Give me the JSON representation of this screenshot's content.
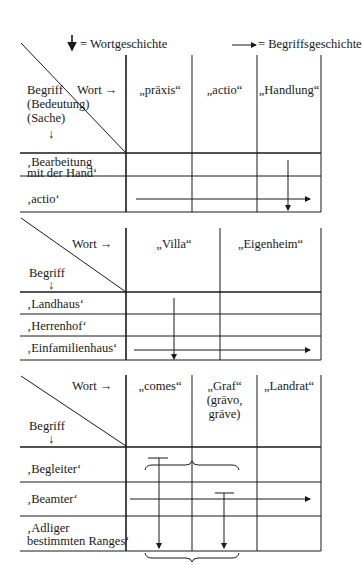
{
  "legend": {
    "word_history_symbol": "↓",
    "word_history_label": "= Wortgeschichte",
    "concept_history_symbol": "⟶",
    "concept_history_label": "= Begriffsgeschichte"
  },
  "table1": {
    "corner_word": "Wort →",
    "corner_concept_lines": [
      "Begriff",
      "(Bedeutung)",
      "(Sache)",
      "↓"
    ],
    "columns": [
      "„präxis“",
      "„actio“",
      "„Handlung“"
    ],
    "rows": [
      [
        "‚Bearbeitung",
        "mit der Hand‘"
      ],
      [
        "‚actio‘"
      ]
    ]
  },
  "table2": {
    "corner_word": "Wort →",
    "corner_concept_lines": [
      "Begriff",
      "↓"
    ],
    "columns": [
      "„Villa“",
      "„Eigenheim“"
    ],
    "rows": [
      [
        "‚Landhaus‘"
      ],
      [
        "‚Herrenhof‘"
      ],
      [
        "‚Einfamilienhaus‘"
      ]
    ]
  },
  "table3": {
    "corner_word": "Wort →",
    "corner_concept_lines": [
      "Begriff",
      "↓"
    ],
    "columns": [
      [
        "„comes“"
      ],
      [
        "„Graf“",
        "(grāvo,",
        "grāve)"
      ],
      [
        "„Landrat“"
      ]
    ],
    "rows": [
      [
        "‚Begleiter‘"
      ],
      [
        "‚Beamter‘"
      ],
      [
        "‚Adliger",
        "bestimmten Ranges‘"
      ]
    ]
  },
  "colors": {
    "ink": "#1a1a1a",
    "background": "#ffffff"
  }
}
